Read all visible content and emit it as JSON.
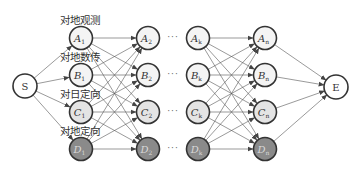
{
  "diagram": {
    "source": {
      "label": "S",
      "x": 25,
      "y": 86
    },
    "sink": {
      "label": "E",
      "x": 336,
      "y": 87
    },
    "radius": 11.5,
    "colors": {
      "A": "#f4f4f4",
      "B": "#f4f4f4",
      "C": "#e4e4e4",
      "D": "#8a8a8a",
      "stroke": "#333333",
      "edge": "#555555"
    },
    "rows": [
      {
        "key": "A",
        "y": 38,
        "category": "对地观测"
      },
      {
        "key": "B",
        "y": 75,
        "category": "对地数传"
      },
      {
        "key": "C",
        "y": 112,
        "category": "对日定向"
      },
      {
        "key": "D",
        "y": 149,
        "category": "对地定向"
      }
    ],
    "columns": [
      {
        "sub": "1",
        "x": 81
      },
      {
        "sub": "2",
        "x": 148
      },
      {
        "sub": "k",
        "x": 198
      },
      {
        "sub": "n",
        "x": 265
      }
    ],
    "ellipsis": "···",
    "category_labels": [
      "对地观测",
      "对地数传",
      "对日定向",
      "对地定向"
    ]
  }
}
